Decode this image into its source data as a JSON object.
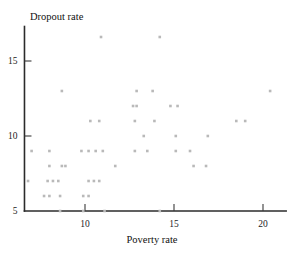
{
  "chart_data": {
    "type": "scatter",
    "title": "",
    "xlabel": "Poverty rate",
    "ylabel": "Dropout rate",
    "xlim": [
      6.6,
      21.3
    ],
    "ylim": [
      5.0,
      17.3
    ],
    "xticks": [
      10,
      15,
      20
    ],
    "yticks": [
      5,
      10,
      15
    ],
    "xtick_labels": [
      "10",
      "15",
      "20"
    ],
    "ytick_labels": [
      "5",
      "10",
      "15"
    ],
    "grid": false,
    "legend": null,
    "marker": "square",
    "marker_color": "#b9b9b9",
    "points": [
      {
        "x": 10.9,
        "y": 16.6
      },
      {
        "x": 14.2,
        "y": 16.6
      },
      {
        "x": 8.7,
        "y": 13.0
      },
      {
        "x": 12.9,
        "y": 13.0
      },
      {
        "x": 13.8,
        "y": 13.0
      },
      {
        "x": 20.4,
        "y": 13.0
      },
      {
        "x": 12.7,
        "y": 12.0
      },
      {
        "x": 12.9,
        "y": 12.0
      },
      {
        "x": 14.8,
        "y": 12.0
      },
      {
        "x": 15.2,
        "y": 12.0
      },
      {
        "x": 10.3,
        "y": 11.0
      },
      {
        "x": 10.8,
        "y": 11.0
      },
      {
        "x": 12.8,
        "y": 11.0
      },
      {
        "x": 13.9,
        "y": 11.0
      },
      {
        "x": 18.5,
        "y": 11.0
      },
      {
        "x": 19.0,
        "y": 11.0
      },
      {
        "x": 13.3,
        "y": 10.0
      },
      {
        "x": 15.1,
        "y": 10.0
      },
      {
        "x": 16.9,
        "y": 10.0
      },
      {
        "x": 7.0,
        "y": 9.0
      },
      {
        "x": 8.0,
        "y": 9.0
      },
      {
        "x": 9.8,
        "y": 9.0
      },
      {
        "x": 10.2,
        "y": 9.0
      },
      {
        "x": 10.6,
        "y": 9.0
      },
      {
        "x": 11.0,
        "y": 9.0
      },
      {
        "x": 12.8,
        "y": 9.0
      },
      {
        "x": 13.5,
        "y": 9.0
      },
      {
        "x": 15.1,
        "y": 9.0
      },
      {
        "x": 15.9,
        "y": 9.0
      },
      {
        "x": 8.0,
        "y": 8.0
      },
      {
        "x": 8.7,
        "y": 8.0
      },
      {
        "x": 8.9,
        "y": 8.0
      },
      {
        "x": 11.7,
        "y": 8.0
      },
      {
        "x": 16.1,
        "y": 8.0
      },
      {
        "x": 16.8,
        "y": 8.0
      },
      {
        "x": 6.8,
        "y": 7.0
      },
      {
        "x": 7.9,
        "y": 7.0
      },
      {
        "x": 8.2,
        "y": 7.0
      },
      {
        "x": 8.5,
        "y": 7.0
      },
      {
        "x": 10.2,
        "y": 7.0
      },
      {
        "x": 10.5,
        "y": 7.0
      },
      {
        "x": 10.8,
        "y": 7.0
      },
      {
        "x": 7.7,
        "y": 6.0
      },
      {
        "x": 8.0,
        "y": 6.0
      },
      {
        "x": 8.6,
        "y": 6.0
      },
      {
        "x": 9.9,
        "y": 6.0
      },
      {
        "x": 10.2,
        "y": 6.0
      },
      {
        "x": 8.6,
        "y": 5.0
      },
      {
        "x": 9.9,
        "y": 5.0
      },
      {
        "x": 11.1,
        "y": 5.0
      },
      {
        "x": 14.2,
        "y": 5.0
      }
    ]
  }
}
